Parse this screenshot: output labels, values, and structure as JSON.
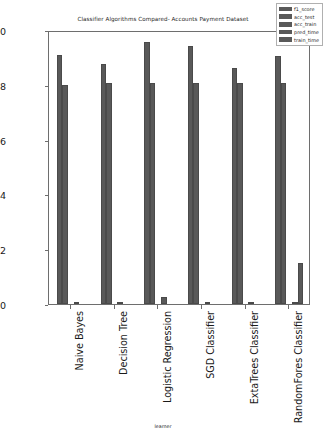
{
  "chart_data": {
    "type": "bar",
    "title": "Classifier Algorithms Compared- Accounts Payment Dataset",
    "xlabel": "learner",
    "ylabel": "",
    "ylim": [
      0.0,
      1.0
    ],
    "yticks": [
      "0.0",
      "0.2",
      "0.4",
      "0.6",
      "0.8",
      "1.0"
    ],
    "ytick_values": [
      0.0,
      0.2,
      0.4,
      0.6,
      0.8,
      1.0
    ],
    "grid": false,
    "legend_position": "upper right",
    "categories": [
      "Naive Bayes",
      "Decision Tree",
      "Logistic Regression",
      "SGD Classifier",
      "ExtaTrees Classifier",
      "RandomFores Classifier"
    ],
    "series": [
      {
        "name": "f1_score",
        "color": "#595959",
        "values": [
          0.91,
          0.875,
          0.955,
          0.94,
          0.862,
          0.905
        ]
      },
      {
        "name": "acc_test",
        "color": "#595959",
        "values": [
          0.8,
          0.805,
          0.808,
          0.806,
          0.805,
          0.805
        ]
      },
      {
        "name": "acc_train",
        "color": "#595959",
        "values": [
          0.0,
          0.0,
          0.0,
          0.0,
          0.0,
          0.0
        ]
      },
      {
        "name": "pred_time",
        "color": "#595959",
        "values": [
          0.004,
          0.005,
          0.025,
          0.006,
          0.009,
          0.008
        ]
      },
      {
        "name": "train_time",
        "color": "#595959",
        "values": [
          0.0,
          0.0,
          0.0,
          0.0,
          0.0,
          0.148
        ]
      }
    ]
  },
  "legend": {
    "items": [
      {
        "label": "f1_score"
      },
      {
        "label": "acc_test"
      },
      {
        "label": "acc_train"
      },
      {
        "label": "pred_time"
      },
      {
        "label": "train_time"
      }
    ]
  }
}
